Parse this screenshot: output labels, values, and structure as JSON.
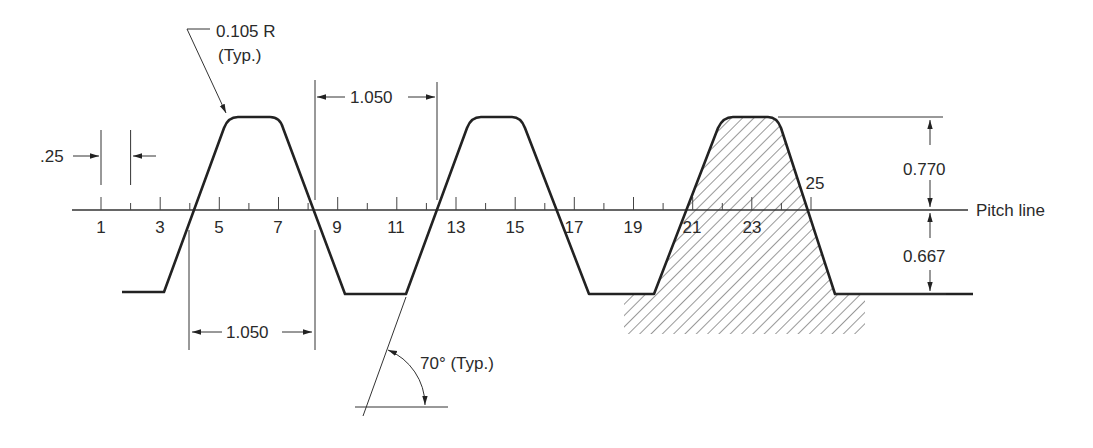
{
  "figure": {
    "labels": {
      "radius": "0.105 R",
      "radius_typ": "(Typ.)",
      "tick_spacing": ".25",
      "pitch_top": "1.050",
      "pitch_bottom": "1.050",
      "addendum": "0.770",
      "dedendum": "0.667",
      "pitch_line": "Pitch line",
      "angle": "70° (Typ.)"
    },
    "tick_numbers": [
      "1",
      "3",
      "5",
      "7",
      "9",
      "11",
      "13",
      "15",
      "17",
      "19",
      "21",
      "23",
      "25"
    ],
    "colors": {
      "line": "#222222",
      "hatch": "#444444",
      "background": "#ffffff"
    }
  }
}
